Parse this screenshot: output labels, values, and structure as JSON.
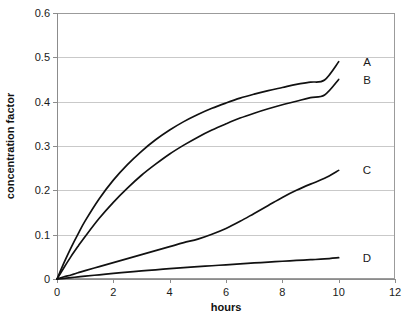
{
  "chart_data": {
    "type": "line",
    "title": "",
    "xlabel": "hours",
    "ylabel": "concentration factor",
    "xlim": [
      0,
      12
    ],
    "ylim": [
      0,
      0.6
    ],
    "grid": "horizontal",
    "legend_position": "right-inline-labels",
    "x_ticks": [
      "0",
      "2",
      "4",
      "6",
      "8",
      "10",
      "12"
    ],
    "x_tick_values": [
      0,
      2,
      4,
      6,
      8,
      10,
      12
    ],
    "y_ticks": [
      "0",
      "0.1",
      "0.2",
      "0.3",
      "0.4",
      "0.5",
      "0.6"
    ],
    "y_tick_values": [
      0,
      0.1,
      0.2,
      0.3,
      0.4,
      0.5,
      0.6
    ],
    "x": [
      0,
      0.25,
      0.5,
      0.75,
      1,
      1.5,
      2,
      2.5,
      3,
      3.5,
      4,
      4.5,
      5,
      5.5,
      6,
      6.5,
      7,
      7.5,
      8,
      8.5,
      9,
      9.5,
      10
    ],
    "series": [
      {
        "name": "A",
        "label": "A",
        "color": "#111111",
        "end_value": 0.49,
        "values": [
          0,
          0.037,
          0.071,
          0.102,
          0.131,
          0.181,
          0.223,
          0.258,
          0.288,
          0.314,
          0.336,
          0.355,
          0.371,
          0.385,
          0.397,
          0.408,
          0.417,
          0.425,
          0.432,
          0.439,
          0.444,
          0.449,
          0.49
        ]
      },
      {
        "name": "B",
        "label": "B",
        "color": "#111111",
        "end_value": 0.45,
        "values": [
          0,
          0.026,
          0.051,
          0.074,
          0.096,
          0.137,
          0.173,
          0.205,
          0.234,
          0.259,
          0.282,
          0.302,
          0.32,
          0.336,
          0.35,
          0.363,
          0.374,
          0.384,
          0.393,
          0.401,
          0.409,
          0.415,
          0.45
        ]
      },
      {
        "name": "C",
        "label": "C",
        "color": "#111111",
        "end_value": 0.245,
        "values": [
          0,
          0.005,
          0.009,
          0.014,
          0.019,
          0.028,
          0.037,
          0.046,
          0.055,
          0.064,
          0.073,
          0.082,
          0.09,
          0.101,
          0.114,
          0.13,
          0.148,
          0.166,
          0.184,
          0.2,
          0.214,
          0.227,
          0.245
        ]
      },
      {
        "name": "D",
        "label": "D",
        "color": "#111111",
        "end_value": 0.048,
        "values": [
          0,
          0.0016,
          0.0032,
          0.0048,
          0.0064,
          0.0095,
          0.0126,
          0.0155,
          0.0182,
          0.0208,
          0.0232,
          0.0255,
          0.0277,
          0.0299,
          0.032,
          0.0341,
          0.0362,
          0.0381,
          0.04,
          0.0418,
          0.0435,
          0.0452,
          0.048
        ]
      }
    ]
  },
  "axes": {
    "y_title": "concentration factor",
    "x_title": "hours"
  }
}
